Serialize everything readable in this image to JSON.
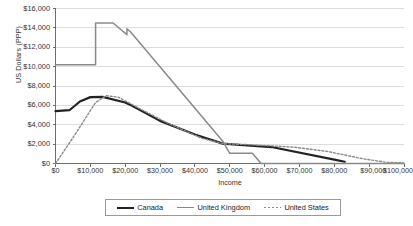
{
  "chart_data": {
    "type": "line",
    "title": "",
    "xlabel": "Income",
    "ylabel": "US Dollars (PPP)",
    "xlim": [
      0,
      100000
    ],
    "ylim": [
      0,
      16000
    ],
    "grid": true,
    "legend_position": "bottom",
    "x_tick_labels": [
      "$0",
      "$10,000",
      "$20,000",
      "$30,000",
      "$40,000",
      "$50,000",
      "$60,000",
      "$70,000",
      "$80,000",
      "$90,000",
      "$100,000"
    ],
    "x_tick_values": [
      0,
      10000,
      20000,
      30000,
      40000,
      50000,
      60000,
      70000,
      80000,
      90000,
      100000
    ],
    "y_tick_labels": [
      "$0",
      "$2,000",
      "$4,000",
      "$6,000",
      "$8,000",
      "$10,000",
      "$12,000",
      "$14,000",
      "$16,000"
    ],
    "y_tick_values": [
      0,
      2000,
      4000,
      6000,
      8000,
      10000,
      12000,
      14000,
      16000
    ],
    "series": [
      {
        "name": "Canada",
        "color": "#222222",
        "style": "solid",
        "width": 2.2,
        "points": [
          [
            0,
            5400
          ],
          [
            4000,
            5500
          ],
          [
            7000,
            6400
          ],
          [
            10000,
            6850
          ],
          [
            13500,
            6880
          ],
          [
            20000,
            6300
          ],
          [
            22000,
            5950
          ],
          [
            30000,
            4400
          ],
          [
            40000,
            3000
          ],
          [
            48000,
            2050
          ],
          [
            58000,
            1780
          ],
          [
            62000,
            1700
          ],
          [
            80000,
            400
          ],
          [
            83000,
            180
          ]
        ]
      },
      {
        "name": "United Kingdom",
        "color": "#8a8a8a",
        "style": "solid",
        "width": 1.5,
        "points": [
          [
            0,
            10200
          ],
          [
            11500,
            10200
          ],
          [
            11500,
            14500
          ],
          [
            16500,
            14500
          ],
          [
            20500,
            13300
          ],
          [
            20500,
            13900
          ],
          [
            21500,
            13600
          ],
          [
            48000,
            2300
          ],
          [
            50000,
            1050
          ],
          [
            56500,
            1050
          ],
          [
            59000,
            0
          ],
          [
            100000,
            0
          ]
        ]
      },
      {
        "name": "United States",
        "color": "#8a8a8a",
        "style": "dotted",
        "width": 1.4,
        "points": [
          [
            0,
            0
          ],
          [
            5000,
            2650
          ],
          [
            11500,
            6300
          ],
          [
            14500,
            7000
          ],
          [
            18000,
            6850
          ],
          [
            24000,
            5700
          ],
          [
            32000,
            4200
          ],
          [
            42000,
            2600
          ],
          [
            48000,
            2050
          ],
          [
            55000,
            1950
          ],
          [
            68000,
            1700
          ],
          [
            78000,
            1250
          ],
          [
            88000,
            500
          ],
          [
            95000,
            120
          ],
          [
            100000,
            60
          ]
        ]
      }
    ]
  },
  "legend": {
    "entries": [
      {
        "label": "Canada"
      },
      {
        "label": "United Kingdom"
      },
      {
        "label": "United States"
      }
    ]
  }
}
